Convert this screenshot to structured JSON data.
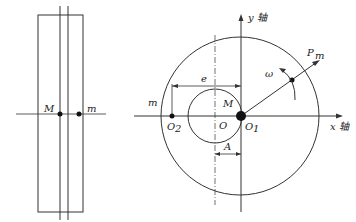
{
  "left_view": {
    "labels": {
      "M": "M",
      "m": "m"
    }
  },
  "right_view": {
    "axes": {
      "y_label": "y 轴",
      "x_label": "x 轴"
    },
    "labels": {
      "P_m": "P",
      "P_m_sub": "m",
      "omega": "ω",
      "e": "e",
      "M": "M",
      "m": "m",
      "O": "O",
      "O1": "O",
      "O1_sub": "1",
      "O2": "O",
      "O2_sub": "2",
      "A": "A"
    }
  }
}
